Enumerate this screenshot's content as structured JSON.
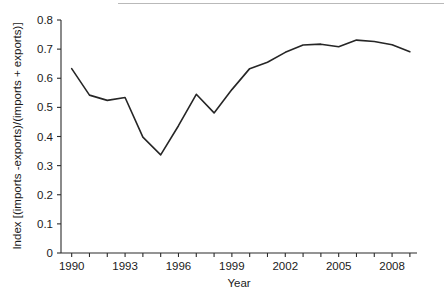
{
  "chart_data": {
    "type": "line",
    "title": "",
    "xlabel": "Year",
    "ylabel": "Index [(imports -exports)/(imports + exports)]",
    "xlim": [
      1989.4,
      2009.4
    ],
    "ylim": [
      0,
      0.8
    ],
    "grid": false,
    "legend": null,
    "xticks_major": [
      1990,
      1993,
      1996,
      1999,
      2002,
      2005,
      2008
    ],
    "xtick_labels": [
      "1990",
      "1993",
      "1996",
      "1999",
      "2002",
      "2005",
      "2008"
    ],
    "xticks_minor": [
      1991,
      1992,
      1994,
      1995,
      1997,
      1998,
      2000,
      2001,
      2003,
      2004,
      2006,
      2007,
      2009
    ],
    "yticks": [
      0,
      0.1,
      0.2,
      0.3,
      0.4,
      0.5,
      0.6,
      0.7,
      0.8
    ],
    "ytick_labels": [
      "0",
      "0.1",
      "0.2",
      "0.3",
      "0.4",
      "0.5",
      "0.6",
      "0.7",
      "0.8"
    ],
    "line_color": "#262626",
    "line_width": 1.6,
    "x": [
      1990,
      1991,
      1992,
      1993,
      1994,
      1995,
      1996,
      1997,
      1998,
      1999,
      2000,
      2001,
      2002,
      2003,
      2004,
      2005,
      2006,
      2007,
      2008,
      2009
    ],
    "values": [
      0.633,
      0.542,
      0.524,
      0.534,
      0.398,
      0.337,
      0.437,
      0.545,
      0.481,
      0.561,
      0.633,
      0.655,
      0.689,
      0.714,
      0.717,
      0.708,
      0.731,
      0.726,
      0.715,
      0.691
    ],
    "series": [
      {
        "name": "Index [(imports -exports)/(imports + exports)]",
        "values": [
          0.633,
          0.542,
          0.524,
          0.534,
          0.398,
          0.337,
          0.437,
          0.545,
          0.481,
          0.561,
          0.633,
          0.655,
          0.689,
          0.714,
          0.717,
          0.708,
          0.731,
          0.726,
          0.715,
          0.691
        ]
      }
    ]
  },
  "axes": {
    "x_title": "Year",
    "y_title": "Index [(imports -exports)/(imports + exports)]"
  }
}
